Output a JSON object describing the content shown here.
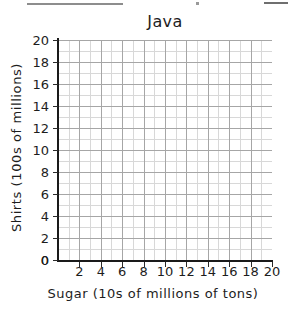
{
  "artifacts": {
    "top_rule_left": "horizontal-rule",
    "top_rule_right": "horizontal-rule",
    "speck": "scan-speck"
  },
  "chart_data": {
    "type": "scatter",
    "title": "Java",
    "xlabel": "Sugar (10s of millions of tons)",
    "ylabel": "Shirts (100s of millions)",
    "xlim": [
      0,
      20
    ],
    "ylim": [
      0,
      20
    ],
    "xticks": [
      0,
      2,
      4,
      6,
      8,
      10,
      12,
      14,
      16,
      18,
      20
    ],
    "yticks": [
      0,
      2,
      4,
      6,
      8,
      10,
      12,
      14,
      16,
      18,
      20
    ],
    "xtick_labels": [
      "0",
      "2",
      "4",
      "6",
      "8",
      "10",
      "12",
      "14",
      "16",
      "18",
      "20"
    ],
    "ytick_labels": [
      "0",
      "2",
      "4",
      "6",
      "8",
      "10",
      "12",
      "14",
      "16",
      "18",
      "20"
    ],
    "grid": true,
    "grid_minor_step": 1,
    "grid_major_step": 2,
    "legend": null,
    "series": [
      {
        "name": "Java",
        "x": [],
        "y": []
      }
    ],
    "annotations": [],
    "note": "Empty plotting grid — no data points, lines, or bars are drawn."
  },
  "colors": {
    "background": "#ffffff",
    "axis": "#1a1a1a",
    "grid_minor": "#d8d8d8",
    "grid_major": "#a6a6a6",
    "text": "#1d1d1d"
  }
}
